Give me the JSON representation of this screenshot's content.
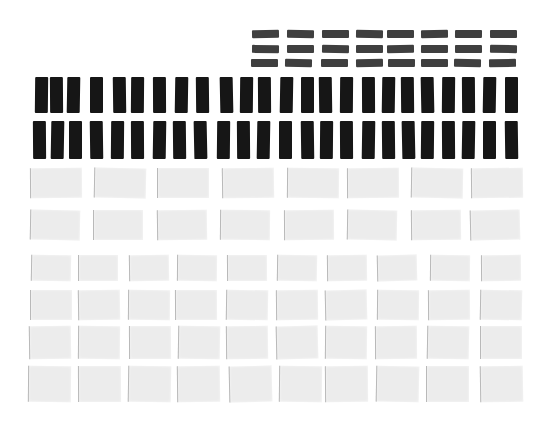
{
  "scene": {
    "description": "Grid arrangement of paper rectangles: dark gray small bars, black vertical bars, light gray tiles",
    "background": "#ffffff",
    "colors": {
      "dashbar": "#3f3f3f",
      "blackbar": "#161616",
      "paper": "#ececec",
      "paper_edge": "#b9b9b9"
    }
  },
  "groups": [
    {
      "name": "dark-gray-bars",
      "kind": "dashbar",
      "rows": [
        {
          "y": 30,
          "h": 8,
          "xs": [
            252,
            287,
            322,
            356,
            387,
            421,
            455,
            490
          ],
          "w": 27
        },
        {
          "y": 45,
          "h": 8,
          "xs": [
            252,
            287,
            322,
            356,
            387,
            421,
            455,
            490
          ],
          "w": 27
        },
        {
          "y": 59,
          "h": 8,
          "xs": [
            251,
            285,
            321,
            356,
            388,
            421,
            454,
            489
          ],
          "w": 27
        }
      ]
    },
    {
      "name": "black-bars",
      "kind": "blackbar",
      "rows": [
        {
          "y": 77,
          "h": 36,
          "w": 13,
          "xs": [
            35,
            50,
            67,
            90,
            113,
            131,
            153,
            175,
            196,
            220,
            240,
            258,
            280,
            301,
            319,
            340,
            362,
            382,
            401,
            421,
            442,
            462,
            483,
            505
          ]
        },
        {
          "y": 121,
          "h": 38,
          "w": 13,
          "xs": [
            33,
            51,
            69,
            90,
            111,
            131,
            153,
            173,
            194,
            217,
            237,
            257,
            279,
            301,
            320,
            340,
            362,
            382,
            402,
            421,
            442,
            462,
            483,
            505
          ]
        }
      ]
    },
    {
      "name": "paper-tiles-upper",
      "kind": "paper",
      "rows": [
        {
          "y": 168,
          "h": 30,
          "w": 52,
          "xs": [
            30,
            94,
            157,
            222,
            287,
            347,
            411,
            471
          ]
        },
        {
          "y": 210,
          "h": 30,
          "w": 50,
          "xs": [
            30,
            93,
            157,
            220,
            284,
            347,
            411,
            470
          ]
        }
      ]
    },
    {
      "name": "paper-tiles-lower",
      "kind": "paper",
      "rows": [
        {
          "y": 255,
          "h": 26,
          "w": 40,
          "xs": [
            31,
            78,
            129,
            177,
            227,
            277,
            327,
            377,
            430,
            481
          ]
        },
        {
          "y": 290,
          "h": 30,
          "w": 42,
          "xs": [
            30,
            78,
            128,
            175,
            226,
            276,
            325,
            377,
            428,
            480
          ]
        },
        {
          "y": 326,
          "h": 33,
          "w": 42,
          "xs": [
            29,
            78,
            129,
            178,
            226,
            276,
            325,
            375,
            427,
            480
          ]
        },
        {
          "y": 366,
          "h": 36,
          "w": 43,
          "xs": [
            28,
            78,
            128,
            177,
            229,
            279,
            325,
            376,
            426,
            480
          ]
        }
      ]
    }
  ]
}
